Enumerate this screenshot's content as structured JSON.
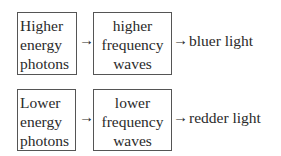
{
  "rows": [
    {
      "source": {
        "lines": [
          "Higher",
          "energy",
          "photons"
        ]
      },
      "middle": {
        "lines": [
          "higher",
          "frequency",
          "waves"
        ]
      },
      "arrow": "→",
      "result": "bluer light"
    },
    {
      "source": {
        "lines": [
          "Lower",
          "energy",
          "photons"
        ]
      },
      "middle": {
        "lines": [
          "lower",
          "frequency",
          "waves"
        ]
      },
      "arrow": "→",
      "result": "redder light"
    }
  ]
}
